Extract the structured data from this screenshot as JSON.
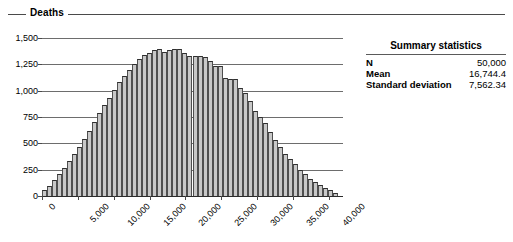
{
  "group": {
    "legend_label": "Deaths"
  },
  "summary": {
    "title": "Summary statistics",
    "rows": [
      {
        "label": "N",
        "value": "50,000"
      },
      {
        "label": "Mean",
        "value": "16,744.4"
      },
      {
        "label": "Standard deviation",
        "value": "7,562.34"
      }
    ]
  },
  "chart_data": {
    "type": "bar",
    "title": "",
    "subtitle": "",
    "xlabel": "",
    "ylabel": "Deaths",
    "grid": true,
    "legend_position": "none",
    "xlim": [
      0,
      42000
    ],
    "ylim": [
      0,
      1500
    ],
    "ytick_labels": [
      "1,500",
      "1,250",
      "1,000",
      "750",
      "500",
      "250",
      "0"
    ],
    "ytick_values": [
      1500,
      1250,
      1000,
      750,
      500,
      250,
      0
    ],
    "xtick_labels": [
      "0",
      "5,000",
      "10,000",
      "15,000",
      "20,000",
      "25,000",
      "30,000",
      "35,000",
      "40,000"
    ],
    "xtick_values": [
      0,
      5000,
      10000,
      15000,
      20000,
      25000,
      30000,
      35000,
      40000
    ],
    "bin_width": 700,
    "categories": [
      350,
      1050,
      1750,
      2450,
      3150,
      3850,
      4550,
      5250,
      5950,
      6650,
      7350,
      8050,
      8750,
      9450,
      10150,
      10850,
      11550,
      12250,
      12950,
      13650,
      14350,
      15050,
      15750,
      16450,
      17150,
      17850,
      18550,
      19250,
      19950,
      20650,
      21350,
      22050,
      22750,
      23450,
      24150,
      24850,
      25550,
      26250,
      26950,
      27650,
      28350,
      29050,
      29750,
      30450,
      31150,
      31850,
      32550,
      33250,
      33950,
      34650,
      35350,
      36050,
      36750,
      37450,
      38150,
      38850,
      39550,
      40250,
      40950
    ],
    "values": [
      55,
      95,
      150,
      210,
      265,
      330,
      400,
      470,
      545,
      620,
      700,
      790,
      860,
      930,
      1005,
      1080,
      1140,
      1200,
      1255,
      1300,
      1340,
      1360,
      1385,
      1395,
      1370,
      1390,
      1400,
      1395,
      1355,
      1330,
      1330,
      1330,
      1320,
      1280,
      1230,
      1230,
      1125,
      1115,
      1110,
      1030,
      980,
      900,
      810,
      750,
      690,
      610,
      530,
      470,
      400,
      350,
      300,
      250,
      205,
      165,
      135,
      105,
      80,
      55,
      30
    ]
  }
}
